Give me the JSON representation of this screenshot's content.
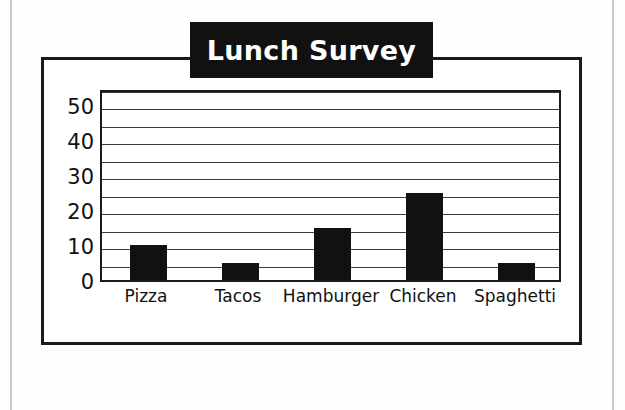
{
  "page": {
    "background_color": "#fefefe",
    "rule_color": "#c9c9c9"
  },
  "figure": {
    "frame_color": "#1a1a1a",
    "banner_color": "#111111",
    "banner_text_color": "#ffffff",
    "title": "Lunch Survey"
  },
  "chart_data": {
    "type": "bar",
    "title": "Lunch Survey",
    "xlabel": "",
    "ylabel": "",
    "categories": [
      "Pizza",
      "Tacos",
      "Hamburger",
      "Chicken",
      "Spaghetti"
    ],
    "values": [
      10,
      5,
      15,
      25,
      5
    ],
    "series": [
      {
        "name": "Votes",
        "values": [
          10,
          5,
          15,
          25,
          5
        ]
      }
    ],
    "ylim": [
      0,
      55
    ],
    "ytick_labels": [
      "0",
      "10",
      "20",
      "30",
      "40",
      "50"
    ],
    "ytick_values": [
      0,
      10,
      20,
      30,
      40,
      50
    ],
    "gridline_values": [
      5,
      10,
      15,
      20,
      25,
      30,
      35,
      40,
      45,
      50,
      55
    ],
    "grid": true,
    "grid_interval": 5,
    "legend": "none",
    "bar_color": "#111111",
    "plot_background": "#ffffff"
  }
}
